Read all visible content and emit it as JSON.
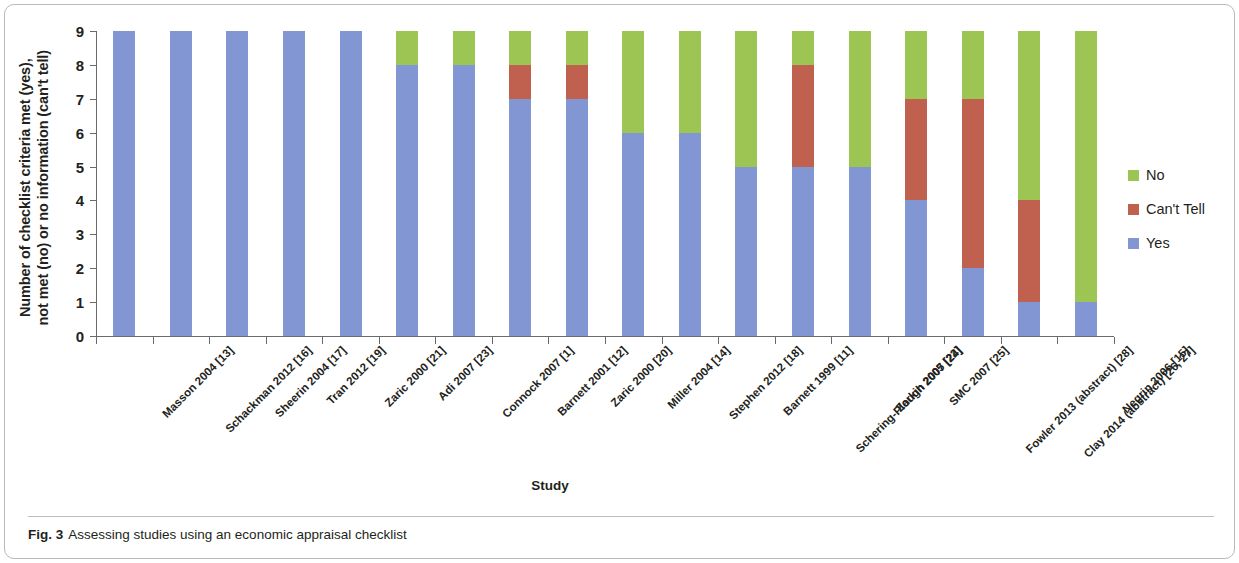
{
  "figure": {
    "caption_label": "Fig. 3",
    "caption_text": "Assessing studies using an economic appraisal checklist"
  },
  "colors": {
    "yes": "#8296d4",
    "cant_tell": "#c0604e",
    "no": "#9dc554",
    "axis": "#6a6a6a",
    "text": "#231f20"
  },
  "legend": {
    "position": "right",
    "items": [
      {
        "label": "No",
        "color": "#9dc554"
      },
      {
        "label": "Can't Tell",
        "color": "#c0604e"
      },
      {
        "label": "Yes",
        "color": "#8296d4"
      }
    ]
  },
  "chart_data": {
    "type": "bar",
    "stacked": true,
    "title": "",
    "xlabel": "Study",
    "ylabel": "Number of checklist criteria met (yes), not met (no) or no information (can't tell)",
    "ylabel_line1": "Number of checklist criteria met (yes),",
    "ylabel_line2": "not met (no) or no information (can't tell)",
    "ylim": [
      0,
      9
    ],
    "yticks": [
      0,
      1,
      2,
      3,
      4,
      5,
      6,
      7,
      8,
      9
    ],
    "grid": false,
    "categories": [
      "Masson 2004 [13]",
      "Schackman 2012 [16]",
      "Sheerin 2004 [17]",
      "Tran 2012 [19]",
      "Zaric 2000 [21]",
      "Adi 2007 [23]",
      "Connock 2007 [1]",
      "Barnett 2001 [12]",
      "Zaric 2000 [20]",
      "Miller 2004 [14]",
      "Stephen 2012 [18]",
      "Barnett 1999 [11]",
      "Schering-Plough 2007 [24]",
      "Zarkin 2005 [22]",
      "SMC 2007 [25]",
      "Fowler 2013 (abstract) [28]",
      "Clay 2014 (abstract) [26, 27]",
      "Negrin 2006 [15]"
    ],
    "series": [
      {
        "name": "Yes",
        "color": "#8296d4",
        "values": [
          9,
          9,
          9,
          9,
          9,
          8,
          8,
          7,
          7,
          6,
          6,
          5,
          5,
          5,
          4,
          2,
          1,
          1
        ]
      },
      {
        "name": "Can't Tell",
        "color": "#c0604e",
        "values": [
          0,
          0,
          0,
          0,
          0,
          0,
          0,
          1,
          1,
          0,
          0,
          0,
          3,
          0,
          3,
          5,
          3,
          0
        ]
      },
      {
        "name": "No",
        "color": "#9dc554",
        "values": [
          0,
          0,
          0,
          0,
          0,
          1,
          1,
          1,
          1,
          3,
          3,
          4,
          1,
          4,
          2,
          2,
          5,
          8
        ]
      }
    ]
  }
}
